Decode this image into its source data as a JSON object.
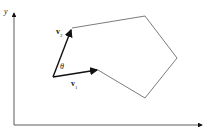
{
  "diagram": {
    "axes": {
      "y_label": "y",
      "x_label": ""
    },
    "vectors": [
      {
        "name": "v",
        "subscript": "1"
      },
      {
        "name": "v",
        "subscript": "2"
      }
    ],
    "angle_label": "θ",
    "polygon_vertices": [
      [
        72,
        28
      ],
      [
        145,
        16
      ],
      [
        177,
        58
      ],
      [
        145,
        98
      ],
      [
        98,
        70
      ],
      [
        53,
        77
      ]
    ],
    "colors": {
      "stroke": "#333333",
      "arrow": "#111111"
    }
  }
}
